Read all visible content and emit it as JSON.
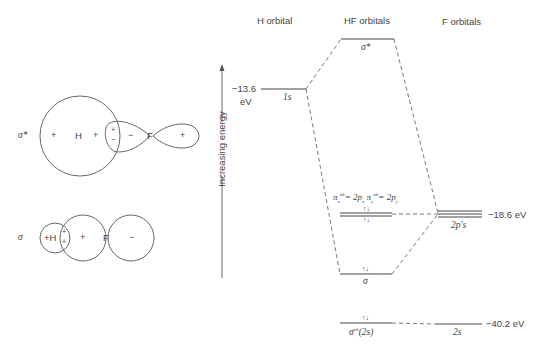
{
  "headers": {
    "h_orbital": "H orbital",
    "hf_orbitals": "HF orbitals",
    "f_orbitals": "F orbitals"
  },
  "axis": {
    "label": "Increasing energy",
    "direction": "up"
  },
  "energies": {
    "h_1s": "−13.6",
    "h_1s_unit": "eV",
    "f_2p": "−18.6 eV",
    "f_2s": "−40.2 eV"
  },
  "levels": {
    "h_1s_label": "1s",
    "sigma_star_label": "σ*",
    "pi_nb_label": "πx nb = 2px  πy nb = 2py",
    "pi_x": "π",
    "pi_x_sub": "x",
    "pi_sup": "nb",
    "pi_eq_x": "= 2p",
    "pi_y": "π",
    "pi_y_sub": "y",
    "pi_eq_y": "= 2p",
    "sigma_label": "σ",
    "sigma_nb_label": "σ",
    "sigma_nb_sup": "nb",
    "sigma_nb_paren": "(2s)",
    "f_2p_label": "2p's",
    "f_2s_label": "2s",
    "electron_pair": "↑↓"
  },
  "orbital_pictures": {
    "sigma_star": {
      "label": "σ*",
      "h_label": "H",
      "f_label": "F",
      "signs": [
        "+",
        "+",
        "+",
        "−",
        "−",
        "+"
      ]
    },
    "sigma": {
      "label": "σ",
      "h_label": "+H",
      "f_label": "F",
      "signs": [
        "+",
        "+",
        "+",
        "−"
      ]
    }
  },
  "colors": {
    "line": "#555555",
    "text": "#444444"
  }
}
